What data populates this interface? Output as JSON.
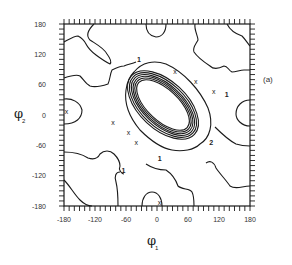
{
  "chart_data": {
    "type": "contour",
    "title": "",
    "panel_label": "(a)",
    "xlabel": "φ",
    "xlabel_sub": "1",
    "ylabel": "φ",
    "ylabel_sub": "2",
    "xlim": [
      -180,
      180
    ],
    "ylim": [
      -180,
      180
    ],
    "x_ticks": [
      "-180",
      "-120",
      "-60",
      "0",
      "60",
      "120",
      "180"
    ],
    "y_ticks": [
      "180",
      "120",
      "60",
      "0",
      "-60",
      "-120",
      "-180"
    ],
    "grid": false,
    "minor_ticks_step": 10,
    "contour_level_labels": [
      {
        "text": "1",
        "phi1": -35,
        "phi2": 105
      },
      {
        "text": "1",
        "phi1": 135,
        "phi2": 35
      },
      {
        "text": "1",
        "phi1": -65,
        "phi2": -115
      },
      {
        "text": "1",
        "phi1": 5,
        "phi2": -90
      },
      {
        "text": "2",
        "phi1": 105,
        "phi2": -60
      }
    ],
    "central_well": {
      "center": [
        0,
        5
      ],
      "orientation_deg": -45,
      "nested_ellipses": 7,
      "description": "concentric elliptical contours elongated along the anti-diagonal"
    },
    "markers": [
      {
        "symbol": "x",
        "phi1": 35,
        "phi2": 85
      },
      {
        "symbol": "x",
        "phi1": 75,
        "phi2": 65
      },
      {
        "symbol": "x",
        "phi1": 110,
        "phi2": 45
      },
      {
        "symbol": "x",
        "phi1": -85,
        "phi2": -15
      },
      {
        "symbol": "x",
        "phi1": -55,
        "phi2": -35
      },
      {
        "symbol": "x",
        "phi1": -40,
        "phi2": -55
      },
      {
        "symbol": "x",
        "phi1": -175,
        "phi2": 5
      },
      {
        "symbol": "x",
        "phi1": 5,
        "phi2": -175
      }
    ]
  }
}
